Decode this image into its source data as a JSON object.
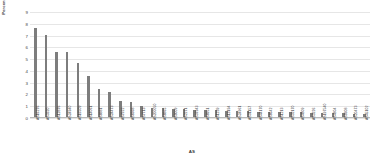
{
  "chart_data": {
    "type": "bar",
    "title": "",
    "xlabel": "AS",
    "ylabel": "Percentage (%)",
    "ylim": [
      0,
      9
    ],
    "yticks": [
      0,
      1,
      2,
      3,
      4,
      5,
      6,
      7,
      8,
      9
    ],
    "grid": true,
    "legend": "none",
    "bar_color": "#7d7d7d",
    "categories": [
      "AS16276",
      "AS3320",
      "AS12876",
      "AS24940",
      "AS16509",
      "AS14061",
      "AS8881",
      "AS24473",
      "AS7922",
      "AS8368",
      "AS7713",
      "AS200050",
      "AS8865",
      "AS9009",
      "AS2271",
      "AS37943",
      "AS8951",
      "AS1239",
      "AS13194",
      "AS24961",
      "AS31157",
      "AS44170",
      "AS8642",
      "AS1213",
      "AS32170",
      "AS4809",
      "AS3226",
      "AS197540",
      "AS4804",
      "AS9308",
      "AS20473",
      "AS45102"
    ],
    "values": [
      7.6,
      7.0,
      5.5,
      5.5,
      4.6,
      3.5,
      2.4,
      2.1,
      1.4,
      1.3,
      0.9,
      0.8,
      0.8,
      0.7,
      0.7,
      0.6,
      0.6,
      0.6,
      0.55,
      0.5,
      0.5,
      0.45,
      0.45,
      0.4,
      0.4,
      0.4,
      0.35,
      0.35,
      0.3,
      0.3,
      0.25,
      0.25
    ]
  }
}
